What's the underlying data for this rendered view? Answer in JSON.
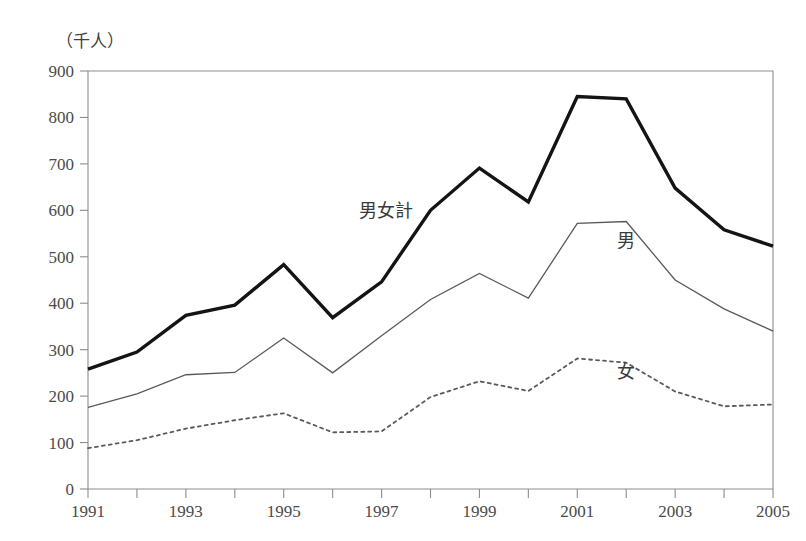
{
  "page": {
    "faint_top_text": "",
    "unit_label": "（千人）"
  },
  "chart_data": {
    "type": "line",
    "title": "",
    "xlabel": "",
    "ylabel": "（千人）",
    "unit": "千人",
    "x": [
      1991,
      1992,
      1993,
      1994,
      1995,
      1996,
      1997,
      1998,
      1999,
      2000,
      2001,
      2002,
      2003,
      2004,
      2005
    ],
    "xtick_labels": [
      "1991",
      "",
      "1993",
      "",
      "1995",
      "",
      "1997",
      "",
      "1999",
      "",
      "2001",
      "",
      "2003",
      "",
      "2005"
    ],
    "xlim": [
      1991,
      2005
    ],
    "ylim": [
      0,
      900
    ],
    "ytick_labels": [
      "0",
      "100",
      "200",
      "300",
      "400",
      "500",
      "600",
      "700",
      "800",
      "900"
    ],
    "yticks": [
      0,
      100,
      200,
      300,
      400,
      500,
      600,
      700,
      800,
      900
    ],
    "grid": false,
    "legend_position": "inline-annotations",
    "series": [
      {
        "name": "男女計",
        "style": "thick-solid-black",
        "color": "#141414",
        "label_x": 1997.1,
        "label_y": 585,
        "values": [
          258,
          295,
          374,
          396,
          483,
          369,
          446,
          600,
          691,
          618,
          845,
          840,
          648,
          558,
          523
        ]
      },
      {
        "name": "男",
        "style": "thin-solid-gray",
        "color": "#5a5a5a",
        "label_x": 2002.0,
        "label_y": 522,
        "values": [
          176,
          205,
          246,
          251,
          325,
          250,
          330,
          408,
          464,
          411,
          572,
          576,
          450,
          388,
          340
        ]
      },
      {
        "name": "女",
        "style": "dotted-gray",
        "color": "#5a5a5a",
        "label_x": 2002.0,
        "label_y": 240,
        "values": [
          88,
          105,
          130,
          148,
          163,
          122,
          124,
          198,
          232,
          211,
          281,
          272,
          210,
          178,
          182
        ]
      }
    ]
  }
}
